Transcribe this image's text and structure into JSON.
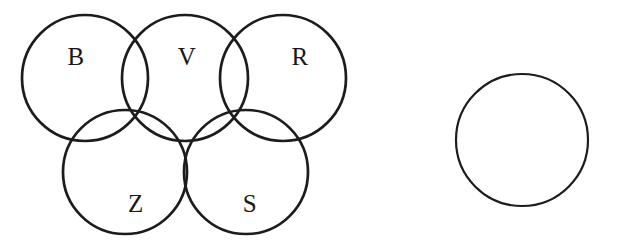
{
  "figure": {
    "type": "venn-diagram",
    "background_color": "#ffffff",
    "stroke_color": "#1c1c1c",
    "label_color": "#181818",
    "canvas": {
      "width": 619,
      "height": 248
    }
  },
  "diagram": {
    "name": "overlapping-circle-diagram",
    "circle_count": 5,
    "circles": [
      {
        "id": "B",
        "label": "B",
        "cx": 85,
        "cy": 78,
        "r": 63,
        "label_x": 76,
        "label_y": 59
      },
      {
        "id": "V",
        "label": "V",
        "cx": 185,
        "cy": 78,
        "r": 63,
        "label_x": 187,
        "label_y": 59
      },
      {
        "id": "R",
        "label": "R",
        "cx": 283,
        "cy": 78,
        "r": 63,
        "label_x": 300,
        "label_y": 59
      },
      {
        "id": "Z",
        "label": "Z",
        "cx": 125,
        "cy": 172,
        "r": 62,
        "label_x": 136,
        "label_y": 206
      },
      {
        "id": "S",
        "label": "S",
        "cx": 246,
        "cy": 172,
        "r": 62,
        "label_x": 250,
        "label_y": 206
      }
    ]
  },
  "lone_shape": {
    "name": "standalone-circle",
    "label": "",
    "cx": 522,
    "cy": 140,
    "r": 66
  }
}
